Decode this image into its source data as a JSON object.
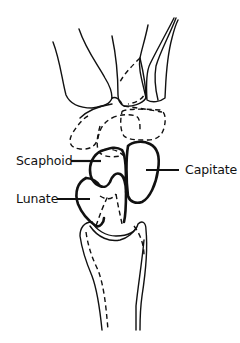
{
  "diagram": {
    "labels": {
      "scaphoid": "Scaphoid",
      "lunate": "Lunate",
      "capitate": "Capitate"
    },
    "colors": {
      "line": "#111111",
      "background": "#ffffff"
    }
  }
}
